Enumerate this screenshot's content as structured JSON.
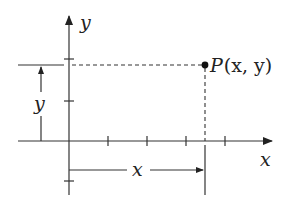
{
  "diagram": {
    "axes": {
      "x_label": "x",
      "y_label": "y"
    },
    "point": {
      "label": "P",
      "coords_text": "(x, y)"
    },
    "dimensions": {
      "horizontal_distance_label": "x",
      "vertical_distance_label": "y"
    },
    "colors": {
      "line": "#333333",
      "background": "#ffffff"
    }
  }
}
